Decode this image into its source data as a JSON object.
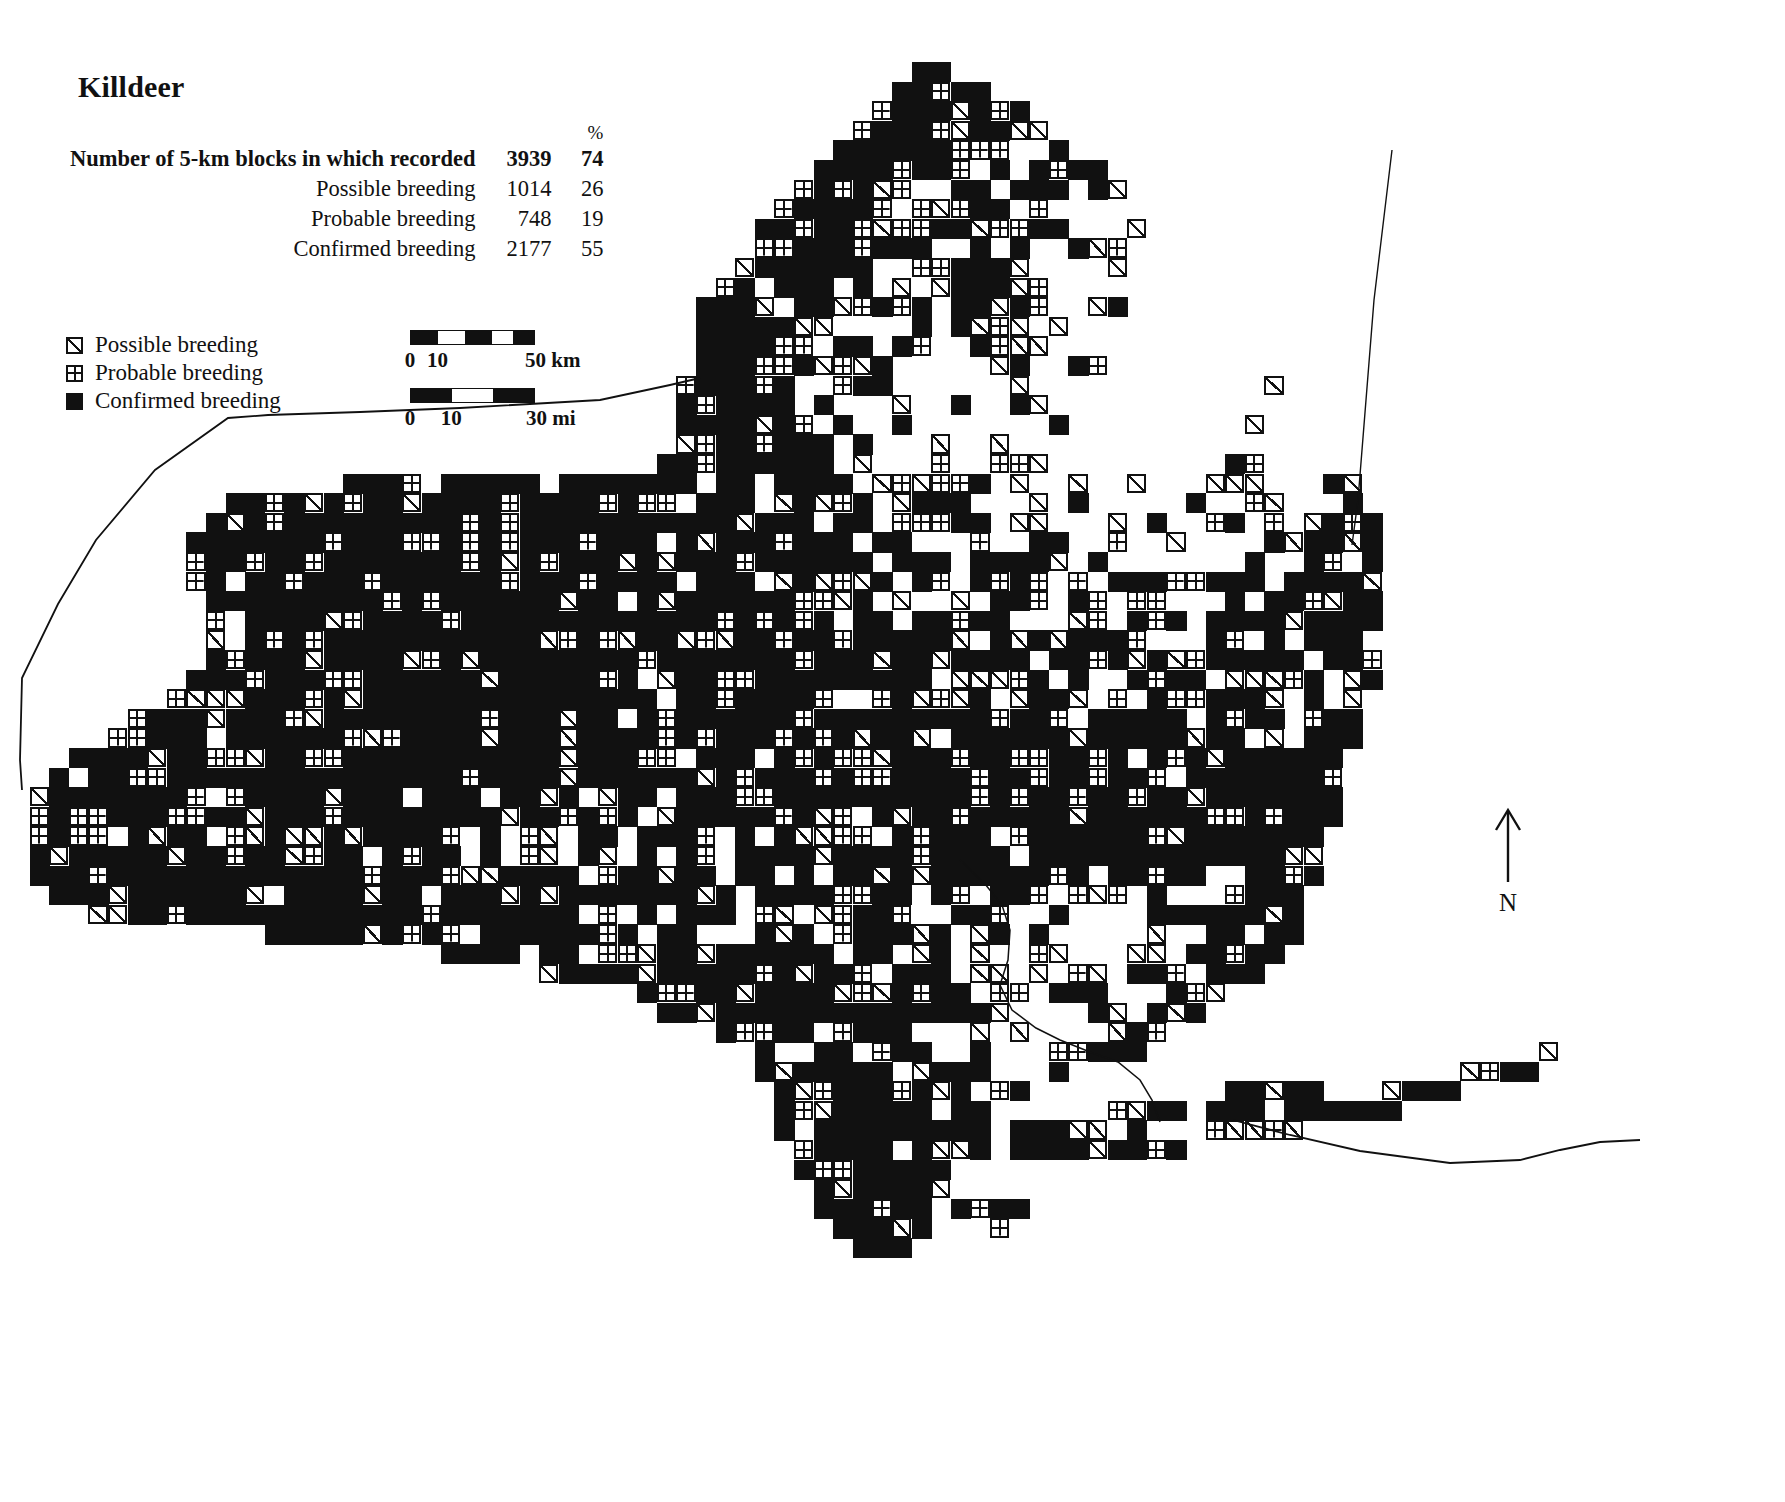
{
  "title": "Killdeer",
  "stats": {
    "percent_header": "%",
    "rows": [
      {
        "label": "Number of 5-km blocks in which recorded",
        "count": "3939",
        "pct": "74",
        "bold": true
      },
      {
        "label": "Possible breeding",
        "count": "1014",
        "pct": "26",
        "bold": false
      },
      {
        "label": "Probable breeding",
        "count": "748",
        "pct": "19",
        "bold": false
      },
      {
        "label": "Confirmed breeding",
        "count": "2177",
        "pct": "55",
        "bold": false
      }
    ]
  },
  "legend": {
    "items": [
      {
        "symbol": "possible",
        "label": "Possible breeding"
      },
      {
        "symbol": "probable",
        "label": "Probable breeding"
      },
      {
        "symbol": "confirmed",
        "label": "Confirmed breeding"
      }
    ]
  },
  "scale_bars": [
    {
      "unit": "km",
      "ticks": [
        "0",
        "10",
        "50 km"
      ],
      "tick_positions": [
        0,
        22,
        100
      ],
      "segments": [
        {
          "fill": true,
          "width": 22
        },
        {
          "fill": false,
          "width": 22
        },
        {
          "fill": true,
          "width": 22
        },
        {
          "fill": false,
          "width": 17
        },
        {
          "fill": true,
          "width": 17
        }
      ],
      "width_px": 125
    },
    {
      "unit": "mi",
      "ticks": [
        "0",
        "10",
        "30 mi"
      ],
      "tick_positions": [
        0,
        33,
        100
      ],
      "segments": [
        {
          "fill": true,
          "width": 33
        },
        {
          "fill": false,
          "width": 34
        },
        {
          "fill": true,
          "width": 33
        }
      ],
      "width_px": 125
    }
  ],
  "north_arrow": {
    "label": "N",
    "direction": "up"
  },
  "chart_data": {
    "type": "map",
    "map_subject": "New York State Breeding Bird Atlas distribution map",
    "species": "Killdeer",
    "grid_block_size": "5 km",
    "totals": {
      "blocks_recorded": 3939,
      "blocks_recorded_pct": 74,
      "possible_breeding": 1014,
      "possible_breeding_pct": 26,
      "probable_breeding": 748,
      "probable_breeding_pct": 19,
      "confirmed_breeding": 2177,
      "confirmed_breeding_pct": 55
    },
    "categories": [
      "Possible breeding",
      "Probable breeding",
      "Confirmed breeding"
    ],
    "values": [
      1014,
      748,
      2177
    ],
    "percentages": [
      26,
      19,
      55
    ],
    "symbols": {
      "possible": "square-with-diagonal",
      "probable": "square-with-cross",
      "confirmed": "filled-square"
    },
    "grid": {
      "cell_px": 19.6,
      "origin_x": 10,
      "origin_y": 62,
      "cols": 90,
      "rows": 64,
      "note": "Occupancy generated from regional density fields approximating the published atlas map: dense statewide coverage with a conspicuous gap over the Adirondack and Catskill highlands."
    },
    "regions": [
      {
        "name": "Lake Plain / Western NY",
        "density": 0.95,
        "dominant": "confirmed"
      },
      {
        "name": "Finger Lakes",
        "density": 0.93,
        "dominant": "confirmed"
      },
      {
        "name": "Mohawk Valley",
        "density": 0.9,
        "dominant": "confirmed"
      },
      {
        "name": "Adirondacks",
        "density": 0.2,
        "dominant": "possible"
      },
      {
        "name": "Catskills / Southern Tier",
        "density": 0.7,
        "dominant": "mixed"
      },
      {
        "name": "Hudson Valley",
        "density": 0.85,
        "dominant": "confirmed"
      },
      {
        "name": "Long Island",
        "density": 0.75,
        "dominant": "confirmed"
      }
    ]
  }
}
